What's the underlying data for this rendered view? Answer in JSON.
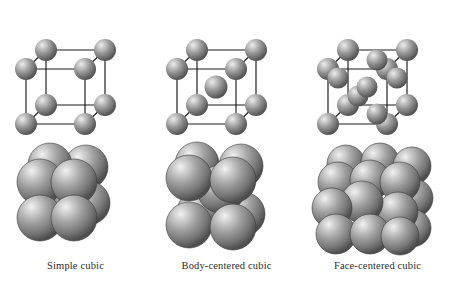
{
  "figure": {
    "background_color": "#ffffff",
    "sphere_color": "#8a8a8a",
    "sphere_highlight_color": "#e8e8e8",
    "sphere_shadow_color": "#4a4a4a",
    "bond_color": "#1a1a1a",
    "row_top_description": "ball-and-stick unit cell models",
    "row_bottom_description": "space-filling packed sphere models"
  },
  "cells": [
    {
      "id": "simple-cubic",
      "label": "Simple cubic",
      "lattice": {
        "type": "ball-and-stick",
        "corner_atoms": 8,
        "face_atoms": 0,
        "body_atoms": 0,
        "total_atoms": 8
      },
      "packing": {
        "type": "space-filling",
        "visible_spheres": 8
      }
    },
    {
      "id": "body-centered-cubic",
      "label": "Body-centered cubic",
      "lattice": {
        "type": "ball-and-stick",
        "corner_atoms": 8,
        "face_atoms": 0,
        "body_atoms": 1,
        "total_atoms": 9
      },
      "packing": {
        "type": "space-filling",
        "visible_spheres": 9
      }
    },
    {
      "id": "face-centered-cubic",
      "label": "Face-centered cubic",
      "lattice": {
        "type": "ball-and-stick",
        "corner_atoms": 8,
        "face_atoms": 6,
        "body_atoms": 0,
        "total_atoms": 14
      },
      "packing": {
        "type": "space-filling",
        "visible_spheres": 14
      }
    }
  ]
}
